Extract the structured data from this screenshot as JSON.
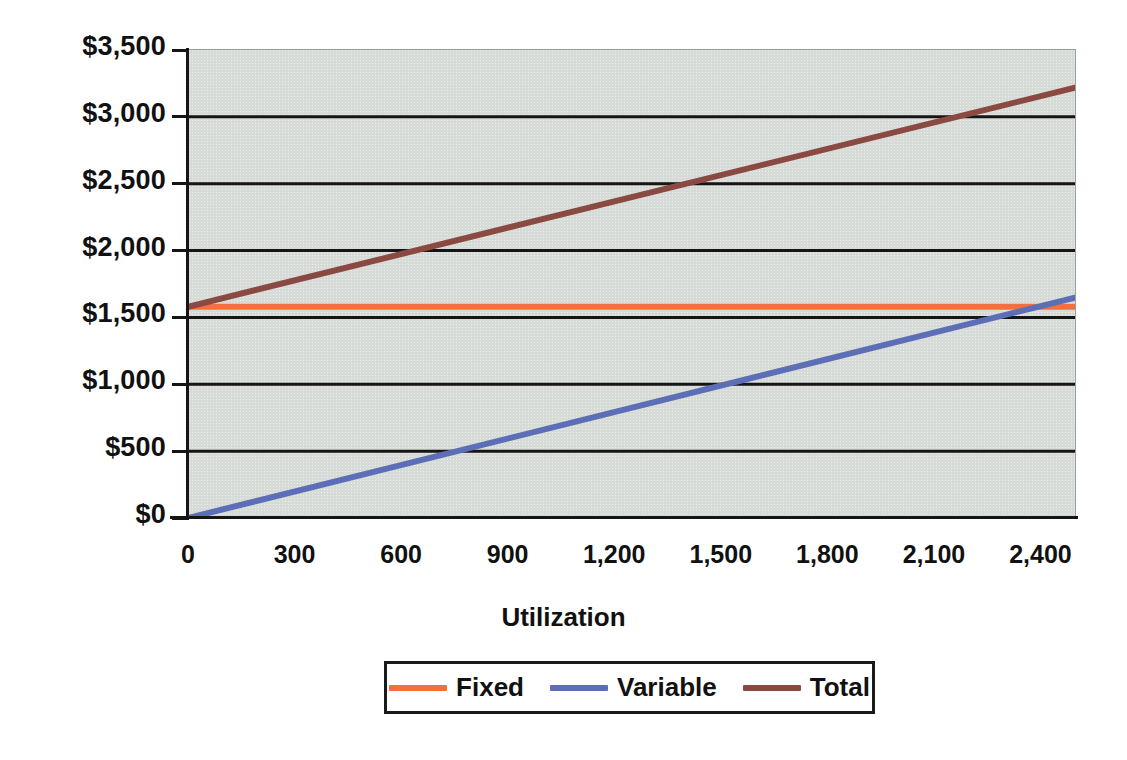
{
  "chart_data": {
    "type": "line",
    "title": "",
    "xlabel": "Utilization",
    "ylabel": "",
    "xlim": [
      0,
      2500
    ],
    "ylim": [
      0,
      3500
    ],
    "grid": true,
    "legend_position": "bottom",
    "x_tick_labels": [
      "0",
      "300",
      "600",
      "900",
      "1,200",
      "1,500",
      "1,800",
      "2,100",
      "2,400"
    ],
    "x_tick_values": [
      0,
      300,
      600,
      900,
      1200,
      1500,
      1800,
      2100,
      2400
    ],
    "y_tick_labels": [
      "$0",
      "$500",
      "$1,000",
      "$1,500",
      "$2,000",
      "$2,500",
      "$3,000",
      "$3,500"
    ],
    "y_tick_values": [
      0,
      500,
      1000,
      1500,
      2000,
      2500,
      3000,
      3500
    ],
    "x": [
      0,
      2500
    ],
    "series": [
      {
        "name": "Fixed",
        "color": "#F2703C",
        "values": [
          1580,
          1580
        ]
      },
      {
        "name": "Variable",
        "color": "#5C6FB6",
        "values": [
          0,
          1650
        ]
      },
      {
        "name": "Total",
        "color": "#8A4A42",
        "values": [
          1580,
          3220
        ]
      }
    ]
  },
  "legend": {
    "items": [
      {
        "label": "Fixed",
        "color": "#F2703C"
      },
      {
        "label": "Variable",
        "color": "#5C6FB6"
      },
      {
        "label": "Total",
        "color": "#8A4A42"
      }
    ]
  },
  "colors": {
    "plot_background": "#d7dbd7",
    "page_background": "#ffffff",
    "gridline": "#151515",
    "axis": "#151515",
    "text": "#111111"
  }
}
